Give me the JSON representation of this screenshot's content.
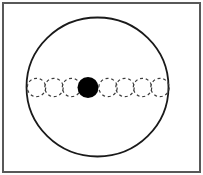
{
  "canvas": {
    "width": 203,
    "height": 175,
    "background": "#fdfdfd"
  },
  "frame": {
    "inset": 3,
    "stroke_color": "#585858",
    "stroke_width": 2,
    "fill": "#ffffff"
  },
  "boundary_circle": {
    "cx": 97.5,
    "cy": 87,
    "rx": 71,
    "ry": 69.5,
    "stroke_color": "#1a1a1a",
    "stroke_width": 1.8,
    "fill": "none"
  },
  "particle_chain": {
    "cy": 87.5,
    "dashed_radius": 9.2,
    "dashed_stroke_color": "#3d3d3d",
    "dashed_stroke_width": 1.2,
    "dash_pattern": "3 2.8",
    "filled_radius": 10.5,
    "filled_color": "#000000",
    "positions": [
      {
        "cx": 36.5,
        "type": "dashed"
      },
      {
        "cx": 54,
        "type": "dashed"
      },
      {
        "cx": 71.5,
        "type": "dashed"
      },
      {
        "cx": 88,
        "type": "filled"
      },
      {
        "cx": 108,
        "type": "dashed"
      },
      {
        "cx": 125,
        "type": "dashed"
      },
      {
        "cx": 142.5,
        "type": "dashed"
      },
      {
        "cx": 160,
        "type": "dashed"
      }
    ]
  }
}
